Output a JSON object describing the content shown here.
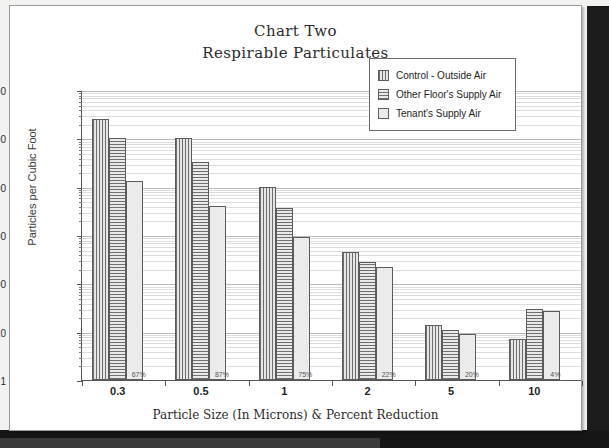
{
  "chart_data": {
    "type": "bar",
    "title": "Chart Two",
    "subtitle": "Respirable Particulates",
    "xlabel": "Particle Size (In Microns) & Percent Reduction",
    "ylabel": "Particles per Cubic Foot",
    "yscale": "log",
    "ylim": [
      1,
      1000000
    ],
    "yticks": [
      "1000000",
      "100000",
      "10000",
      "1000",
      "100",
      "10",
      "1"
    ],
    "ytick_values": [
      1000000,
      100000,
      10000,
      1000,
      100,
      10,
      1
    ],
    "grid": true,
    "legend_position": "upper right",
    "categories": [
      "0.3",
      "0.5",
      "1",
      "2",
      "5",
      "10"
    ],
    "series": [
      {
        "name": "Control - Outside Air",
        "values": [
          250000,
          100000,
          10000,
          450,
          14,
          7
        ]
      },
      {
        "name": "Other Floor's Supply Air",
        "values": [
          100000,
          32000,
          3600,
          280,
          11,
          29
        ]
      },
      {
        "name": "Tenant's Supply Air",
        "values": [
          13000,
          4000,
          900,
          220,
          9,
          27
        ]
      }
    ],
    "annotations": [
      {
        "category": "0.3",
        "label": "67%"
      },
      {
        "category": "0.5",
        "label": "87%"
      },
      {
        "category": "1",
        "label": "75%"
      },
      {
        "category": "2",
        "label": "22%"
      },
      {
        "category": "5",
        "label": "20%"
      },
      {
        "category": "10",
        "label": "4%"
      }
    ]
  },
  "legend": {
    "items": [
      {
        "label": "Control - Outside Air",
        "pattern": "vertical-stripes"
      },
      {
        "label": "Other Floor's Supply Air",
        "pattern": "horizontal-stripes"
      },
      {
        "label": "Tenant's Supply Air",
        "pattern": "solid-light"
      }
    ]
  },
  "colors": {
    "series_1": "#6e6e6e",
    "series_2": "#6e6e6e",
    "series_3": "#ebebeb",
    "grid": "#b9b9b9",
    "axis": "#555555",
    "text": "#1f1f1f"
  }
}
